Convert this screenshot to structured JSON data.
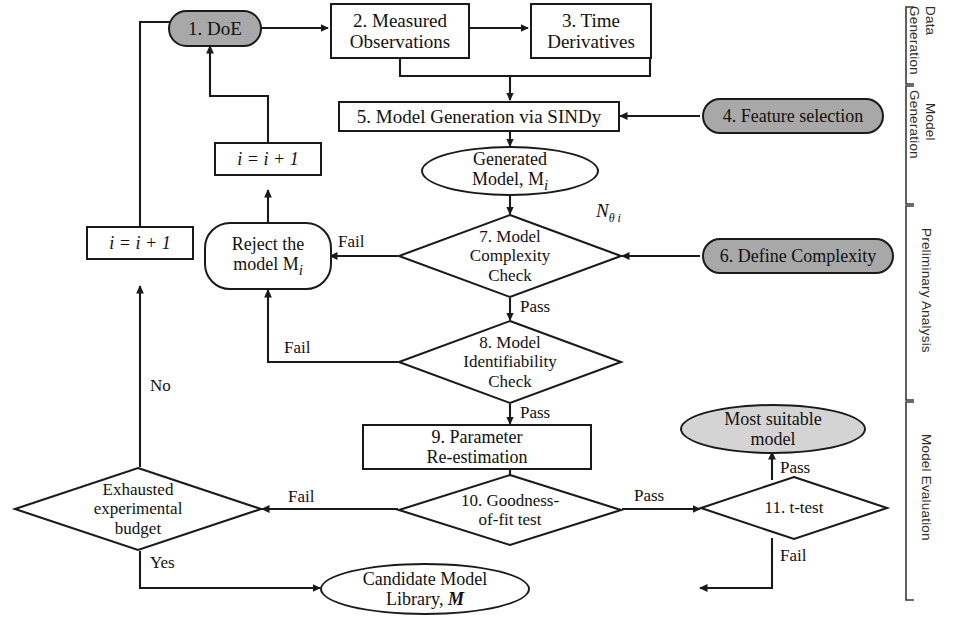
{
  "figure": {
    "type": "flowchart"
  },
  "nodes": {
    "doe": {
      "label": "1. DoE",
      "shape": "stadium",
      "fill": "#a8a8a8"
    },
    "measured_observations": {
      "label": "2. Measured\nObservations",
      "line1": "2. Measured",
      "line2": "Observations",
      "shape": "rectangle",
      "fill": "#ffffff"
    },
    "time_derivatives": {
      "label": "3. Time\nDerivatives",
      "line1": "3. Time",
      "line2": "Derivatives",
      "shape": "rectangle",
      "fill": "#ffffff"
    },
    "feature_selection": {
      "label": "4. Feature selection",
      "shape": "stadium",
      "fill": "#a8a8a8"
    },
    "model_generation": {
      "label": "5. Model Generation via SINDy",
      "shape": "rectangle",
      "fill": "#ffffff"
    },
    "generated_model": {
      "line1": "Generated",
      "line2": "Model, M",
      "sub": "i",
      "shape": "ellipse",
      "fill": "#ffffff"
    },
    "define_complexity": {
      "label": "6. Define Complexity",
      "shape": "stadium",
      "fill": "#a8a8a8"
    },
    "complexity_check": {
      "line1": "7. Model",
      "line2": "Complexity",
      "line3": "Check",
      "shape": "diamond"
    },
    "identifiability_check": {
      "line1": "8. Model",
      "line2": "Identifiability",
      "line3": "Check",
      "shape": "diamond"
    },
    "parameter_reestimation": {
      "line1": "9. Parameter",
      "line2": "Re-estimation",
      "shape": "rectangle",
      "fill": "#ffffff"
    },
    "goodness_of_fit": {
      "line1": "10. Goodness-",
      "line2": "of-fit test",
      "shape": "diamond"
    },
    "t_test": {
      "label": "11. t-test",
      "shape": "diamond"
    },
    "most_suitable_model": {
      "line1": "Most suitable",
      "line2": "model",
      "shape": "ellipse",
      "fill": "#d4d4d4"
    },
    "candidate_library": {
      "line1": "Candidate Model",
      "line2": "Library, ",
      "bold": "M",
      "shape": "ellipse",
      "fill": "#ffffff"
    },
    "reject_model": {
      "line1": "Reject the",
      "line2": "model M",
      "sub": "i",
      "shape": "stadium",
      "fill": "#ffffff"
    },
    "increment_top": {
      "label": "i = i + 1",
      "shape": "rectangle",
      "fill": "#ffffff"
    },
    "increment_left": {
      "label": "i = i + 1",
      "shape": "rectangle",
      "fill": "#ffffff"
    },
    "exhausted_budget": {
      "line1": "Exhausted",
      "line2": "experimental",
      "line3": "budget",
      "shape": "diamond"
    }
  },
  "edge_labels": {
    "n_theta": "N",
    "n_theta_sub": "θ i",
    "complexity_fail": "Fail",
    "complexity_pass": "Pass",
    "identifiability_fail": "Fail",
    "identifiability_pass": "Pass",
    "gof_fail": "Fail",
    "gof_pass": "Pass",
    "ttest_pass": "Pass",
    "ttest_fail": "Fail",
    "budget_no": "No",
    "budget_yes": "Yes"
  },
  "stage_brackets": [
    {
      "id": "data-generation",
      "line1": "Data",
      "line2": "Generation",
      "label": "Data Generation"
    },
    {
      "id": "model-generation",
      "line1": "Model",
      "line2": "Generation",
      "label": "Model Generation"
    },
    {
      "id": "preliminary-analysis",
      "label": "Preliminary Analysis"
    },
    {
      "id": "model-evaluation",
      "label": "Model Evaluation"
    }
  ],
  "colors": {
    "stroke": "#1a1a1a",
    "gray_fill": "#a8a8a8",
    "light_gray_fill": "#d4d4d4",
    "white_fill": "#ffffff",
    "text": "#111111"
  },
  "background_text": "ith minimal training data... identifying an assumed true model structure... only..."
}
